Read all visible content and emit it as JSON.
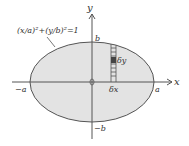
{
  "diagram": {
    "equation": "(x/a)²+(y/b)²=1",
    "axis_x": "x",
    "axis_y": "y",
    "label_a": "a",
    "label_neg_a": "−a",
    "label_b": "b",
    "label_neg_b": "−b",
    "label_dy": "δy",
    "label_dx": "δx",
    "label_origin": "0",
    "colors": {
      "fill": "#e3e3e3",
      "stroke": "#555555",
      "cell": "#444444"
    }
  }
}
